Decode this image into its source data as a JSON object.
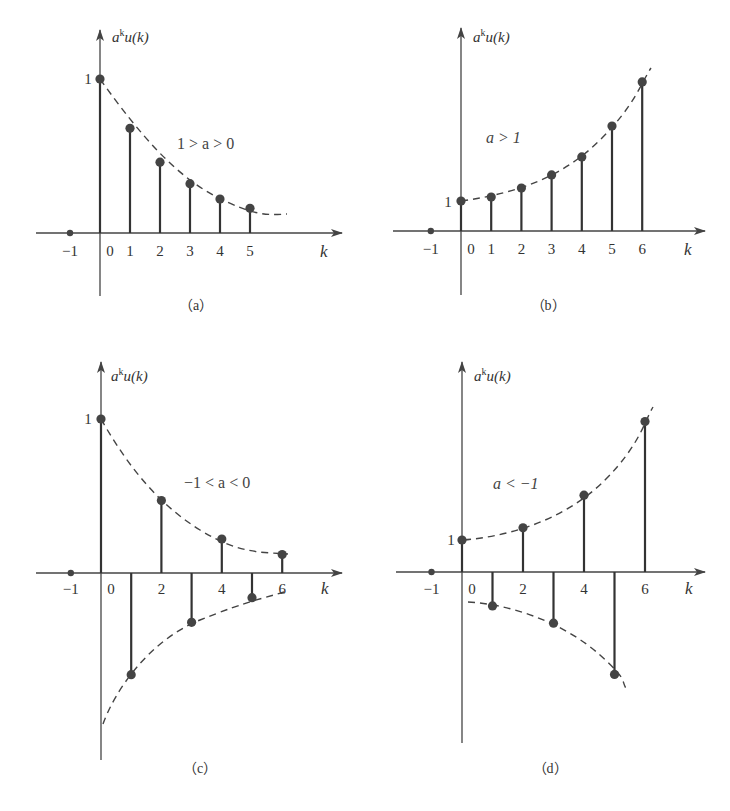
{
  "figure": {
    "panels": [
      {
        "id": "a",
        "caption": "（a）",
        "ylabel_base": "a",
        "ylabel_sup": "k",
        "ylabel_rest": "u(k)",
        "xlabel": "k",
        "condition": "1 > a > 0",
        "one_label": "1"
      },
      {
        "id": "b",
        "caption": "（b）",
        "ylabel_base": "a",
        "ylabel_sup": "k",
        "ylabel_rest": "u(k)",
        "xlabel": "k",
        "condition": "a > 1",
        "one_label": "1"
      },
      {
        "id": "c",
        "caption": "（c）",
        "ylabel_base": "a",
        "ylabel_sup": "k",
        "ylabel_rest": "u(k)",
        "xlabel": "k",
        "condition": "−1 < a < 0",
        "one_label": "1"
      },
      {
        "id": "d",
        "caption": "（d）",
        "ylabel_base": "a",
        "ylabel_sup": "k",
        "ylabel_rest": "u(k)",
        "xlabel": "k",
        "condition": "a < −1",
        "one_label": "1"
      }
    ]
  },
  "chart_data": [
    {
      "type": "stem",
      "title": "(a) 1 > a > 0",
      "xlabel": "k",
      "ylabel": "a^k u(k)",
      "x_ticks": [
        "-1",
        "0",
        "1",
        "2",
        "3",
        "4",
        "5"
      ],
      "y_ticks": [
        "1"
      ],
      "x": [
        -1,
        0,
        1,
        2,
        3,
        4,
        5
      ],
      "values": [
        0,
        1,
        0.68,
        0.46,
        0.32,
        0.22,
        0.16
      ],
      "envelope": "dashed decaying exponential",
      "grid": false
    },
    {
      "type": "stem",
      "title": "(b) a > 1",
      "xlabel": "k",
      "ylabel": "a^k u(k)",
      "x_ticks": [
        "-1",
        "0",
        "1",
        "2",
        "3",
        "4",
        "5",
        "6"
      ],
      "y_ticks": [
        "1"
      ],
      "x": [
        -1,
        0,
        1,
        2,
        3,
        4,
        5,
        6
      ],
      "values": [
        0,
        1,
        1.13,
        1.43,
        1.87,
        2.47,
        3.5,
        4.97
      ],
      "envelope": "dashed growing exponential",
      "grid": false
    },
    {
      "type": "stem",
      "title": "(c) -1 < a < 0",
      "xlabel": "k",
      "ylabel": "a^k u(k)",
      "x_ticks": [
        "-1",
        "0",
        "2",
        "4",
        "6"
      ],
      "y_ticks": [
        "1"
      ],
      "x": [
        -1,
        0,
        1,
        2,
        3,
        4,
        5,
        6
      ],
      "values": [
        0,
        1,
        -0.66,
        0.47,
        -0.32,
        0.22,
        -0.16,
        0.12
      ],
      "envelope": "dashed decaying envelopes ±|a|^k",
      "grid": false
    },
    {
      "type": "stem",
      "title": "(d) a < -1",
      "xlabel": "k",
      "ylabel": "a^k u(k)",
      "x_ticks": [
        "-1",
        "0",
        "2",
        "4",
        "6"
      ],
      "y_ticks": [
        "1"
      ],
      "x": [
        -1,
        0,
        1,
        2,
        3,
        4,
        5,
        6
      ],
      "values": [
        0,
        1,
        -1.06,
        1.38,
        -1.6,
        2.4,
        -3.2,
        4.7
      ],
      "envelope": "dashed growing envelopes ±|a|^k",
      "grid": false
    }
  ]
}
